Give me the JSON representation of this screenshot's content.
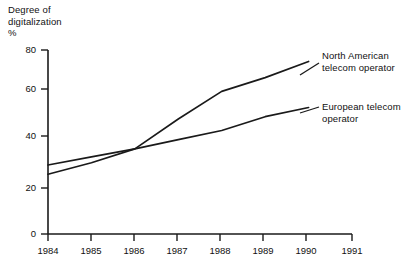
{
  "chart_data": {
    "type": "line",
    "title": "",
    "ylabel": "Degree of\ndigitalization\n%",
    "xlabel": "",
    "x": [
      1984,
      1985,
      1986,
      1987,
      1988,
      1989,
      1990
    ],
    "xlim": [
      1984,
      1991
    ],
    "ylim": [
      0,
      80
    ],
    "xticks": [
      "1984",
      "1985",
      "1986",
      "1987",
      "1988",
      "1989",
      "1990",
      "1991"
    ],
    "yticks": [
      "0",
      "20",
      "40",
      "60",
      "80"
    ],
    "grid": false,
    "legend_position": "inline-annotations",
    "series": [
      {
        "name": "North American telecom operator",
        "values": [
          26,
          31,
          37,
          50,
          62,
          68,
          75
        ]
      },
      {
        "name": "European telecom operator",
        "values": [
          30,
          33.5,
          37,
          41,
          45,
          51,
          55
        ]
      }
    ],
    "annotations": [
      {
        "name": "north-american-label",
        "text": "North American\ntelecom operator"
      },
      {
        "name": "european-label",
        "text": "European telecom\noperator"
      }
    ]
  },
  "axis": {
    "y_title": "Degree of\ndigitalization\n%",
    "y_tick_0": "0",
    "y_tick_20": "20",
    "y_tick_40": "40",
    "y_tick_60": "60",
    "y_tick_80": "80",
    "x_tick_1984": "1984",
    "x_tick_1985": "1985",
    "x_tick_1986": "1986",
    "x_tick_1987": "1987",
    "x_tick_1988": "1988",
    "x_tick_1989": "1989",
    "x_tick_1990": "1990",
    "x_tick_1991": "1991"
  },
  "labels": {
    "north_american": "North American\ntelecom operator",
    "european": "European telecom\noperator"
  },
  "colors": {
    "line": "#1a1a1a",
    "axis": "#1a1a1a",
    "background": "#ffffff",
    "text": "#111111"
  }
}
